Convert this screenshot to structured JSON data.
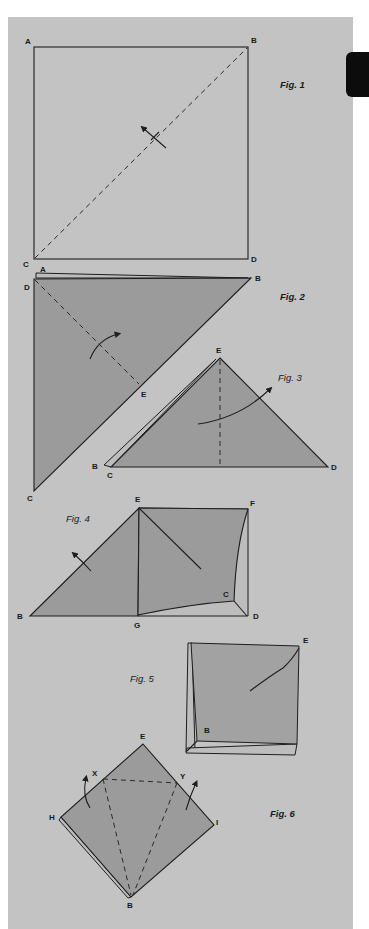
{
  "page": {
    "background": "#ffffff",
    "panel_color": "#c3c3c3",
    "paper_fill": "#9b9b9b",
    "line_color": "#1e1e1e"
  },
  "figures": [
    {
      "caption": "Fig. 1",
      "labels": {
        "a": "A",
        "b": "B",
        "c": "C",
        "d": "D"
      },
      "description": "Square ABCD with dashed diagonal from C to B and a fold arrow"
    },
    {
      "caption": "Fig. 2",
      "labels": {
        "a": "A",
        "d": "D",
        "b": "B",
        "e": "E",
        "c": "C"
      },
      "description": "Triangle folded along diagonal, dashed line D to E with fold arrow"
    },
    {
      "caption": "Fig. 3",
      "labels": {
        "e": "E",
        "b": "B",
        "c": "C",
        "d": "D"
      },
      "description": "Triangle with apex E, dashed vertical center fold, curved arrow"
    },
    {
      "caption": "Fig. 4",
      "labels": {
        "e": "E",
        "f": "F",
        "b": "B",
        "g": "G",
        "c": "C",
        "d": "D"
      },
      "description": "Partially unfolded shape with square flap EFDG and triangle BEG"
    },
    {
      "caption": "Fig. 5",
      "labels": {
        "e": "E",
        "b": "B"
      },
      "description": "Folded square base with layered edges"
    },
    {
      "caption": "Fig. 6",
      "labels": {
        "e": "E",
        "x": "X",
        "y": "Y",
        "h": "H",
        "i": "I",
        "b": "B"
      },
      "description": "Diamond EHIB with dashed kite folds X-Y-B and flap arrows"
    }
  ]
}
